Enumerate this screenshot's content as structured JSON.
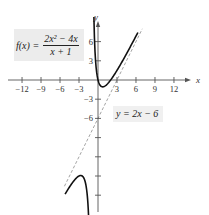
{
  "chart_data": {
    "type": "line",
    "title": "",
    "function_label": {
      "lhs": "f(x) =",
      "numerator": "2x² − 4x",
      "denominator": "x + 1"
    },
    "asymptote_label": "y = 2x − 6",
    "xlabel": "x",
    "ylabel": "y",
    "x_ticks": [
      -12,
      -9,
      -6,
      -3,
      3,
      6,
      9,
      12
    ],
    "x_tick_labels": [
      "−12",
      "−9",
      "−6",
      "−3",
      "3",
      "6",
      "9",
      "12"
    ],
    "y_ticks_labeled": [
      6,
      3,
      -3,
      -6
    ],
    "y_tick_labels": [
      "6",
      "3",
      "−3",
      "−6"
    ],
    "y_ticks_unlabeled": [
      -9,
      -12,
      -15,
      -18
    ],
    "xlim": [
      -14,
      15
    ],
    "ylim": [
      -21,
      9
    ],
    "grid": false,
    "series": [
      {
        "name": "f(x) = (2x² − 4x)/(x + 1)",
        "style": "solid",
        "color": "#111111",
        "branches": [
          {
            "x": [
              -0.65,
              -0.5,
              -0.25,
              0,
              0.5,
              1,
              1.5,
              2,
              3,
              4,
              5,
              6.3
            ],
            "y": [
              8.2,
              5.0,
              2.33,
              0,
              -1.0,
              -1.0,
              -0.6,
              0,
              1.5,
              3.2,
              5.0,
              7.1
            ]
          },
          {
            "x": [
              -1.35,
              -1.5,
              -2,
              -2.73,
              -3.5,
              -4.5,
              -5.2
            ],
            "y": [
              -20.1,
              -18.0,
              -16.0,
              -15.9,
              -16.3,
              -17.3,
              -18.4
            ]
          }
        ]
      },
      {
        "name": "y = 2x − 6",
        "style": "dashed",
        "color": "#999999",
        "x": [
          -5.3,
          7.0
        ],
        "y": [
          -16.6,
          8.0
        ]
      }
    ],
    "vertical_asymptote": "x = −1 (not drawn)"
  },
  "labels": {
    "x_axis": "x",
    "y_axis": "y",
    "f_lhs": "f(x) =",
    "f_num": "2x² − 4x",
    "f_den": "x + 1",
    "asymptote": "y = 2x − 6"
  }
}
